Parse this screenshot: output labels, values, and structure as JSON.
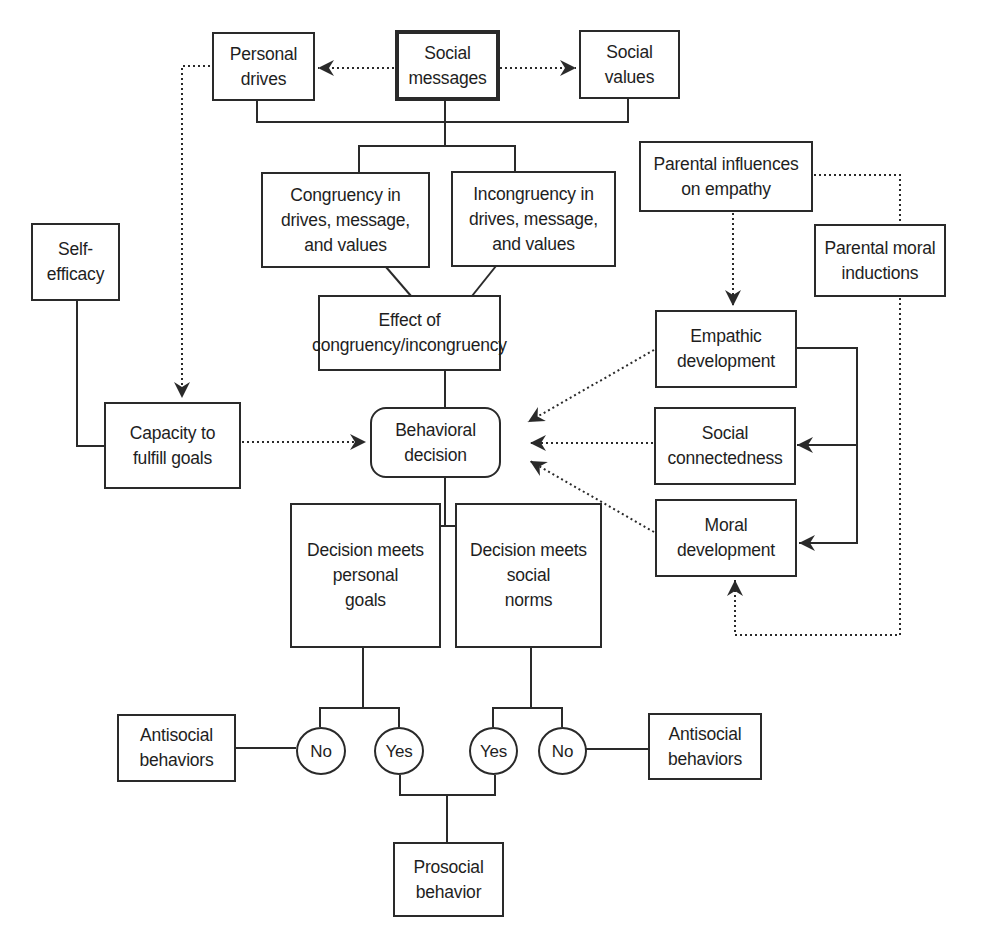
{
  "diagram": {
    "type": "flowchart",
    "nodes": {
      "personal_drives": "Personal\ndrives",
      "social_messages": "Social\nmessages",
      "social_values": "Social\nvalues",
      "congruency": "Congruency in\ndrives, message,\nand values",
      "incongruency": "Incongruency in\ndrives, message,\nand values",
      "effect": "Effect of\ncongruency/incongruency",
      "behavioral_decision": "Behavioral\ndecision",
      "self_efficacy": "Self-\nefficacy",
      "capacity": "Capacity to\nfulfill goals",
      "parental_influences": "Parental influences\non empathy",
      "parental_moral": "Parental moral\ninductions",
      "empathic_development": "Empathic\ndevelopment",
      "social_connectedness": "Social\nconnectedness",
      "moral_development": "Moral\ndevelopment",
      "meets_personal_goals": "Decision meets\npersonal\ngoals",
      "meets_social_norms": "Decision meets\nsocial\nnorms",
      "no_left": "No",
      "yes_left": "Yes",
      "yes_right": "Yes",
      "no_right": "No",
      "antisocial_left": "Antisocial\nbehaviors",
      "antisocial_right": "Antisocial\nbehaviors",
      "prosocial": "Prosocial\nbehavior"
    },
    "edges": [
      {
        "from": "social_messages",
        "to": "personal_drives",
        "style": "dotted-arrow"
      },
      {
        "from": "social_messages",
        "to": "social_values",
        "style": "dotted-arrow"
      },
      {
        "from": "personal_drives",
        "to": "capacity",
        "style": "dotted-arrow"
      },
      {
        "from": "personal_drives+social_messages+social_values",
        "to": "congruency|incongruency",
        "style": "solid"
      },
      {
        "from": "congruency",
        "to": "effect",
        "style": "solid"
      },
      {
        "from": "incongruency",
        "to": "effect",
        "style": "solid"
      },
      {
        "from": "effect",
        "to": "behavioral_decision",
        "style": "solid"
      },
      {
        "from": "self_efficacy",
        "to": "capacity",
        "style": "solid"
      },
      {
        "from": "capacity",
        "to": "behavioral_decision",
        "style": "dotted-arrow"
      },
      {
        "from": "parental_influences",
        "to": "empathic_development",
        "style": "dotted-arrow"
      },
      {
        "from": "parental_influences",
        "to": "parental_moral",
        "style": "dotted"
      },
      {
        "from": "parental_moral",
        "to": "moral_development",
        "style": "dotted-arrow"
      },
      {
        "from": "empathic_development",
        "to": "social_connectedness",
        "style": "solid-arrow"
      },
      {
        "from": "empathic_development",
        "to": "moral_development",
        "style": "solid-arrow"
      },
      {
        "from": "empathic_development",
        "to": "behavioral_decision",
        "style": "dotted-arrow"
      },
      {
        "from": "social_connectedness",
        "to": "behavioral_decision",
        "style": "dotted-arrow"
      },
      {
        "from": "moral_development",
        "to": "behavioral_decision",
        "style": "dotted-arrow"
      },
      {
        "from": "behavioral_decision",
        "to": "meets_personal_goals|meets_social_norms",
        "style": "solid"
      },
      {
        "from": "meets_personal_goals",
        "to": "no_left|yes_left",
        "style": "solid"
      },
      {
        "from": "meets_social_norms",
        "to": "yes_right|no_right",
        "style": "solid"
      },
      {
        "from": "no_left",
        "to": "antisocial_left",
        "style": "solid"
      },
      {
        "from": "no_right",
        "to": "antisocial_right",
        "style": "solid"
      },
      {
        "from": "yes_left+yes_right",
        "to": "prosocial",
        "style": "solid"
      }
    ]
  },
  "colors": {
    "line": "#2a2a2a",
    "background": "#ffffff"
  }
}
